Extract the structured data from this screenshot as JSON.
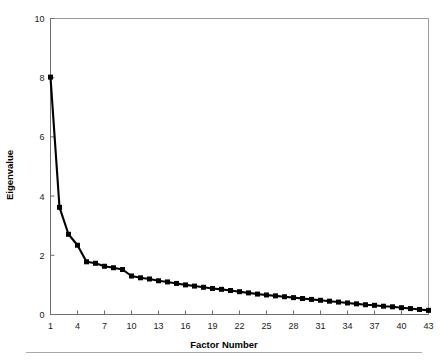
{
  "figure": {
    "background_color": "#ffffff",
    "line_color": "#000000",
    "frame_color": "#9a9a9a",
    "bottom_rule": true
  },
  "chart_data": {
    "type": "line",
    "title": "",
    "subtitle": "",
    "xlabel": "Factor Number",
    "ylabel": "Eigenvalue",
    "xlim": [
      1,
      43
    ],
    "ylim": [
      0,
      10
    ],
    "xticks": [
      1,
      4,
      7,
      10,
      13,
      16,
      19,
      22,
      25,
      28,
      31,
      34,
      37,
      40,
      43
    ],
    "xtick_labels": [
      "1",
      "4",
      "7",
      "10",
      "13",
      "16",
      "19",
      "22",
      "25",
      "28",
      "31",
      "34",
      "37",
      "40",
      "43"
    ],
    "yticks": [
      0,
      2,
      4,
      6,
      8,
      10
    ],
    "ytick_labels": [
      "0",
      "2",
      "4",
      "6",
      "8",
      "10"
    ],
    "grid": false,
    "legend": null,
    "marker": "square",
    "series": [
      {
        "name": "Eigenvalue",
        "x": [
          1,
          2,
          3,
          4,
          5,
          6,
          7,
          8,
          9,
          10,
          11,
          12,
          13,
          14,
          15,
          16,
          17,
          18,
          19,
          20,
          21,
          22,
          23,
          24,
          25,
          26,
          27,
          28,
          29,
          30,
          31,
          32,
          33,
          34,
          35,
          36,
          37,
          38,
          39,
          40,
          41,
          42,
          43
        ],
        "values": [
          8.02,
          3.62,
          2.71,
          2.34,
          1.78,
          1.73,
          1.63,
          1.58,
          1.52,
          1.3,
          1.24,
          1.2,
          1.14,
          1.1,
          1.05,
          1.0,
          0.96,
          0.92,
          0.88,
          0.85,
          0.81,
          0.77,
          0.73,
          0.69,
          0.66,
          0.63,
          0.6,
          0.57,
          0.54,
          0.51,
          0.48,
          0.45,
          0.42,
          0.39,
          0.36,
          0.33,
          0.31,
          0.28,
          0.26,
          0.23,
          0.2,
          0.17,
          0.14
        ]
      }
    ]
  }
}
